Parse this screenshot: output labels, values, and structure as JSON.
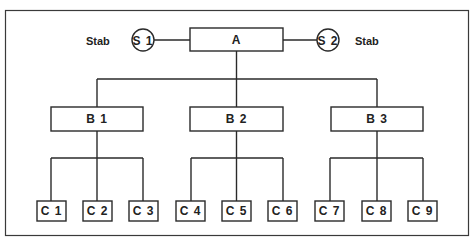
{
  "diagram": {
    "type": "org-chart",
    "root": {
      "label": "A"
    },
    "staff": [
      {
        "label": "S 1",
        "caption": "Stab",
        "side": "left"
      },
      {
        "label": "S 2",
        "caption": "Stab",
        "side": "right"
      }
    ],
    "level_b": [
      {
        "label": "B 1",
        "children": [
          "C 1",
          "C 2",
          "C 3"
        ]
      },
      {
        "label": "B 2",
        "children": [
          "C 4",
          "C 5",
          "C 6"
        ]
      },
      {
        "label": "B 3",
        "children": [
          "C 7",
          "C 8",
          "C 9"
        ]
      }
    ],
    "level_c": [
      "C 1",
      "C 2",
      "C 3",
      "C 4",
      "C 5",
      "C 6",
      "C 7",
      "C 8",
      "C 9"
    ]
  }
}
